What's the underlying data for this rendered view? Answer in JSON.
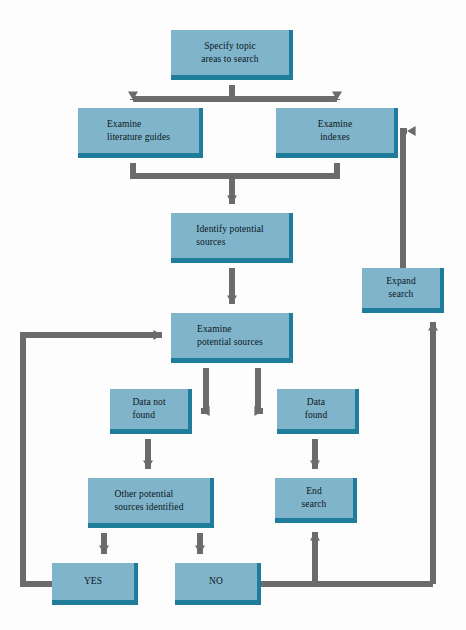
{
  "diagram": {
    "colors": {
      "node_fill": "#7fb4ca",
      "node_edge": "#1f7d9b",
      "connector": "#6b6b6b",
      "text": "#0d1620",
      "background": "#fdfdfd"
    },
    "nodes": [
      {
        "id": "specify",
        "label": "Specify topic\nareas to search",
        "x": 171,
        "y": 30,
        "w": 122,
        "h": 50,
        "align": "center"
      },
      {
        "id": "lit_guides",
        "label": "Examine\nliterature guides",
        "x": 78,
        "y": 108,
        "w": 125,
        "h": 50,
        "align": "left"
      },
      {
        "id": "indexes",
        "label": "Examine\nindexes",
        "x": 276,
        "y": 108,
        "w": 122,
        "h": 50,
        "align": "center"
      },
      {
        "id": "identify",
        "label": "Identify potential\nsources",
        "x": 171,
        "y": 213,
        "w": 122,
        "h": 50,
        "align": "left"
      },
      {
        "id": "examine_pot",
        "label": "Examine\npotential sources",
        "x": 171,
        "y": 313,
        "w": 122,
        "h": 50,
        "align": "left"
      },
      {
        "id": "expand",
        "label": "Expand\nsearch",
        "x": 362,
        "y": 268,
        "w": 82,
        "h": 45,
        "align": "center"
      },
      {
        "id": "data_not_found",
        "label": "Data not\nfound",
        "x": 110,
        "y": 389,
        "w": 82,
        "h": 45,
        "align": "left"
      },
      {
        "id": "data_found",
        "label": "Data\nfound",
        "x": 277,
        "y": 389,
        "w": 82,
        "h": 45,
        "align": "center"
      },
      {
        "id": "other_pot",
        "label": "Other potential\nsources identified",
        "x": 88,
        "y": 478,
        "w": 126,
        "h": 50,
        "align": "left"
      },
      {
        "id": "end_search",
        "label": "End\nsearch",
        "x": 275,
        "y": 478,
        "w": 82,
        "h": 45,
        "align": "center"
      },
      {
        "id": "yes",
        "label": "YES",
        "x": 52,
        "y": 563,
        "w": 86,
        "h": 42,
        "align": "center"
      },
      {
        "id": "no",
        "label": "NO",
        "x": 175,
        "y": 563,
        "w": 86,
        "h": 42,
        "align": "center"
      }
    ],
    "edges": [
      {
        "id": "specify-to-guides",
        "from": "specify",
        "to": "lit_guides"
      },
      {
        "id": "specify-to-indexes",
        "from": "specify",
        "to": "indexes"
      },
      {
        "id": "guides-to-identify",
        "from": "lit_guides",
        "to": "identify"
      },
      {
        "id": "indexes-to-identify",
        "from": "indexes",
        "to": "identify"
      },
      {
        "id": "identify-to-examine",
        "from": "identify",
        "to": "examine_pot"
      },
      {
        "id": "examine-to-datanotfound",
        "from": "examine_pot",
        "to": "data_not_found"
      },
      {
        "id": "examine-to-datafound",
        "from": "examine_pot",
        "to": "data_found"
      },
      {
        "id": "datanotfound-to-otherpot",
        "from": "data_not_found",
        "to": "other_pot"
      },
      {
        "id": "datafound-to-endsearch",
        "from": "data_found",
        "to": "end_search"
      },
      {
        "id": "otherpot-to-yes",
        "from": "other_pot",
        "to": "yes"
      },
      {
        "id": "otherpot-to-no",
        "from": "other_pot",
        "to": "no"
      },
      {
        "id": "yes-to-examine",
        "from": "yes",
        "to": "examine_pot"
      },
      {
        "id": "no-to-endsearch",
        "from": "no",
        "to": "end_search"
      },
      {
        "id": "no-to-expand",
        "from": "no",
        "to": "expand"
      },
      {
        "id": "expand-to-indexes",
        "from": "expand",
        "to": "indexes"
      }
    ]
  }
}
